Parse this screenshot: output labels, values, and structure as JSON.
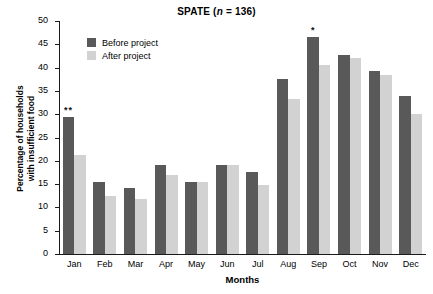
{
  "chart_data": {
    "type": "bar",
    "title": "SPATE (n = 136)",
    "title_prefix": "SPATE (",
    "title_italic": "n",
    "title_suffix": " = 136)",
    "xlabel": "Months",
    "ylabel_line1": "Percentage of households",
    "ylabel_line2": "with insufficient food",
    "categories": [
      "Jan",
      "Feb",
      "Mar",
      "Apr",
      "May",
      "Jun",
      "Jul",
      "Aug",
      "Sep",
      "Oct",
      "Nov",
      "Dec"
    ],
    "series": [
      {
        "name": "Before project",
        "color": "#595959",
        "values": [
          29.4,
          15.4,
          14.1,
          19.2,
          15.4,
          19.2,
          17.7,
          37.6,
          46.5,
          42.7,
          39.2,
          34.0
        ]
      },
      {
        "name": "After project",
        "color": "#d2d2d2",
        "values": [
          21.2,
          12.5,
          11.7,
          16.9,
          15.4,
          19.2,
          14.8,
          33.2,
          40.6,
          42.0,
          38.4,
          30.1
        ]
      }
    ],
    "annotations": [
      {
        "category": "Jan",
        "series": "Before project",
        "text": "**"
      },
      {
        "category": "Sep",
        "series": "Before project",
        "text": "*"
      }
    ],
    "ylim": [
      0,
      50
    ],
    "yticks": [
      0,
      5,
      10,
      15,
      20,
      25,
      30,
      35,
      40,
      45,
      50
    ],
    "ytick_labels": [
      "0",
      "5",
      "10",
      "15",
      "20",
      "25",
      "30",
      "35",
      "40",
      "45",
      "50"
    ],
    "grid": false,
    "legend_position": "upper-left-inside"
  },
  "legend": {
    "items": [
      {
        "label": "Before project",
        "color": "#595959"
      },
      {
        "label": "After project",
        "color": "#d2d2d2"
      }
    ]
  }
}
